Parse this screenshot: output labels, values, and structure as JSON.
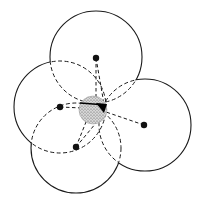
{
  "diagram": {
    "type": "overlapping-circles",
    "background": "#ffffff",
    "stroke_color": "#1a1a1a",
    "dot_color": "#111111",
    "shade_color": "#bdbdbd",
    "center_region": {
      "cx": 93,
      "cy": 110,
      "r": 14,
      "texture": "stippled",
      "wedge": {
        "x1": 96,
        "y1": 103,
        "x2": 107,
        "y2": 104,
        "x3": 104,
        "y3": 113
      }
    },
    "circles": [
      {
        "id": "top",
        "cx": 96,
        "cy": 57,
        "r": 46,
        "dot": {
          "x": 96,
          "y": 58
        }
      },
      {
        "id": "right",
        "cx": 145,
        "cy": 125,
        "r": 46,
        "dot": {
          "x": 144,
          "y": 125
        }
      },
      {
        "id": "left",
        "cx": 60,
        "cy": 107,
        "r": 46,
        "dot": {
          "x": 60,
          "y": 107
        }
      },
      {
        "id": "bottom",
        "cx": 76,
        "cy": 148,
        "r": 45,
        "dot": {
          "x": 76,
          "y": 147
        }
      }
    ],
    "spokes": [
      {
        "from": "top",
        "x1": 96,
        "y1": 58,
        "x2": 96,
        "y2": 98
      },
      {
        "from": "top",
        "x1": 96,
        "y1": 58,
        "x2": 104,
        "y2": 104
      },
      {
        "from": "right",
        "x1": 144,
        "y1": 125,
        "x2": 106,
        "y2": 112
      },
      {
        "from": "left",
        "x1": 60,
        "y1": 107,
        "x2": 82,
        "y2": 108
      },
      {
        "from": "bottom",
        "x1": 76,
        "y1": 147,
        "x2": 86,
        "y2": 122
      },
      {
        "from": "bottom",
        "x1": 76,
        "y1": 147,
        "x2": 96,
        "y2": 123
      }
    ]
  }
}
